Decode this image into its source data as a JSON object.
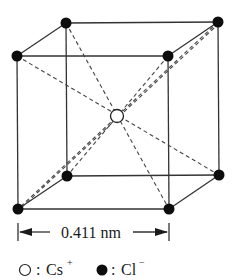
{
  "diagram": {
    "lattice_constant": {
      "value": "0.411",
      "unit": "nm",
      "label": "0.411 nm"
    },
    "legend": [
      {
        "symbol": "open-circle",
        "separator": ":",
        "ion": "Cs",
        "charge": "+"
      },
      {
        "symbol": "filled-circle",
        "separator": ":",
        "ion": "Cl",
        "charge": "−"
      }
    ],
    "atoms": {
      "corners_Cl": [
        {
          "name": "back-top-left",
          "x": 66,
          "y": 23
        },
        {
          "name": "back-top-right",
          "x": 218,
          "y": 22
        },
        {
          "name": "front-top-left",
          "x": 17,
          "y": 56
        },
        {
          "name": "front-top-right",
          "x": 168,
          "y": 56
        },
        {
          "name": "back-bottom-left",
          "x": 67,
          "y": 176
        },
        {
          "name": "back-bottom-right",
          "x": 219,
          "y": 175
        },
        {
          "name": "front-bottom-left",
          "x": 18,
          "y": 209
        },
        {
          "name": "front-bottom-right",
          "x": 169,
          "y": 209
        }
      ],
      "center_Cs": {
        "x": 117,
        "y": 116
      }
    },
    "colors": {
      "line": "#333333",
      "atom_fill_Cl": "#0d0d0d",
      "atom_fill_Cs": "#ffffff"
    }
  }
}
